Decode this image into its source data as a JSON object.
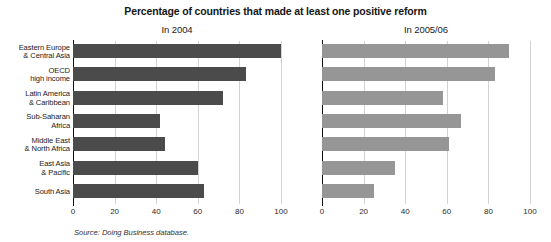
{
  "figure": {
    "title": "Percentage of countries that made at least one positive reform",
    "source": "Source: Doing Business database."
  },
  "chart_data": {
    "type": "bar",
    "orientation": "horizontal",
    "title": "Percentage of countries that made at least one positive reform",
    "xlabel": "",
    "ylabel": "",
    "xlim": [
      0,
      100
    ],
    "xticks": [
      0,
      20,
      40,
      60,
      80,
      100
    ],
    "grid": true,
    "legend": "none",
    "categories": [
      "Eastern Europe & Central Asia",
      "OECD high income",
      "Latin America & Caribbean",
      "Sub-Saharan Africa",
      "Middle East & North Africa",
      "East Asia & Pacific",
      "South Asia"
    ],
    "category_lines": [
      [
        "Eastern Europe",
        "& Central Asia"
      ],
      [
        "OECD",
        "high income"
      ],
      [
        "Latin America",
        "& Caribbean"
      ],
      [
        "Sub-Saharan",
        "Africa"
      ],
      [
        "Middle East",
        "& North Africa"
      ],
      [
        "East Asia",
        "& Pacific"
      ],
      [
        "South Asia"
      ]
    ],
    "panels": [
      {
        "title": "In 2004",
        "color": "#4b4b4b",
        "values": [
          100,
          83,
          72,
          42,
          44,
          60,
          63
        ]
      },
      {
        "title": "In 2005/06",
        "color": "#969696",
        "values": [
          90,
          83,
          58,
          67,
          61,
          35,
          25
        ]
      }
    ]
  }
}
